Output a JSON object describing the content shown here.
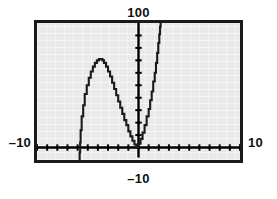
{
  "figure": {
    "name": "graphing-calculator-screen",
    "kind": "graphing calculator viewing window"
  },
  "labels": {
    "top": "100",
    "bottom": "–10",
    "left": "–10",
    "right": "10"
  },
  "colors": {
    "screen_background": "#e9e9e9",
    "frame": "#1a1a1a",
    "curve": "#1a1a1a",
    "axis": "#000000",
    "text": "#111111"
  },
  "chart_data": {
    "type": "line",
    "title": "",
    "subtitle": "",
    "xlabel": "",
    "ylabel": "",
    "xlim": [
      -10,
      10
    ],
    "ylim": [
      -10,
      100
    ],
    "grid": false,
    "legend": false,
    "legend_position": "none",
    "xtick_step": 1,
    "ytick_step": 10,
    "xticks": [
      -10,
      -9,
      -8,
      -7,
      -6,
      -5,
      -4,
      -3,
      -2,
      -1,
      0,
      1,
      2,
      3,
      4,
      5,
      6,
      7,
      8,
      9,
      10
    ],
    "yticks": [
      -10,
      0,
      10,
      20,
      30,
      40,
      50,
      60,
      70,
      80,
      90,
      100
    ],
    "axis_labels_shown": {
      "xmin": "–10",
      "xmax": "10",
      "ymin": "–10",
      "ymax": "100"
    },
    "pixel_rendered": true,
    "render_note": "calculator pixel-stepped curve",
    "series": [
      {
        "name": "left-branch",
        "description": "downward hump rising from below the x-axis near x = -5.8, peaking near x = -3.6, and descending back to the origin",
        "x": [
          -5.8,
          -5.75,
          -5.7,
          -5.6,
          -5.45,
          -5.3,
          -5.1,
          -4.9,
          -4.7,
          -4.5,
          -4.3,
          -4.1,
          -3.9,
          -3.7,
          -3.55,
          -3.4,
          -3.2,
          -3.0,
          -2.8,
          -2.6,
          -2.4,
          -2.2,
          -2.0,
          -1.8,
          -1.6,
          -1.4,
          -1.2,
          -1.0,
          -0.8,
          -0.6,
          -0.4,
          -0.2,
          0.0
        ],
        "y": [
          -12.0,
          -4.0,
          4.0,
          14.0,
          25.0,
          34.0,
          43.0,
          50.0,
          56.0,
          61.0,
          65.0,
          68.0,
          70.0,
          71.0,
          71.0,
          70.0,
          68.0,
          65.0,
          61.0,
          57.0,
          52.0,
          47.0,
          42.0,
          37.0,
          32.0,
          27.0,
          22.0,
          18.0,
          13.0,
          9.0,
          5.5,
          2.5,
          0.0
        ]
      },
      {
        "name": "right-branch",
        "description": "steeply rising branch from the origin up through the top of the window near x = 2.2",
        "x": [
          0.0,
          0.2,
          0.4,
          0.6,
          0.8,
          1.0,
          1.15,
          1.3,
          1.45,
          1.6,
          1.72,
          1.84,
          1.95,
          2.05,
          2.12,
          2.18,
          2.22
        ],
        "y": [
          0.0,
          3.0,
          7.0,
          12.0,
          18.0,
          25.0,
          31.0,
          38.0,
          45.0,
          53.0,
          60.0,
          68.0,
          76.0,
          84.0,
          91.0,
          97.0,
          100.0
        ]
      },
      {
        "name": "y-axis-overshoot",
        "description": "vertical axis segment drawn slightly past the bottom of the plotted axis",
        "x": [
          0.0,
          0.0
        ],
        "y": [
          -10.0,
          100.0
        ]
      }
    ]
  }
}
